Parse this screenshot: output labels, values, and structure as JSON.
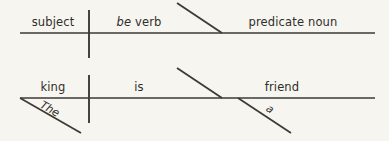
{
  "page": {
    "background_color": "#f7f5f0",
    "line_color": "#3a3a38",
    "text_color": "#2e2e2c"
  },
  "diagrams": [
    {
      "id": "template-row",
      "role": "pattern",
      "subject": "subject",
      "verb_italic_part": "be",
      "verb_plain_part": " verb",
      "verb_full": "be verb",
      "complement": "predicate noun",
      "modifiers": []
    },
    {
      "id": "example-row",
      "role": "example",
      "subject": "king",
      "verb_italic_part": "",
      "verb_plain_part": "is",
      "verb_full": "is",
      "complement": "friend",
      "modifiers": [
        {
          "word": "The",
          "attaches_to": "subject",
          "position": "left"
        },
        {
          "word": "a",
          "attaches_to": "complement",
          "position": "right"
        }
      ]
    }
  ],
  "geometry": {
    "row1": {
      "baseline_y": 33,
      "baseline_x1": 20,
      "baseline_x2": 375,
      "divider_x": 89,
      "divider_y1": 10,
      "divider_y2": 58,
      "slant_x1": 177,
      "slant_y1": 3,
      "slant_x2": 222,
      "slant_y2": 33,
      "subject_x": 53,
      "verb_x": 139,
      "complement_x": 293,
      "label_y": 26
    },
    "row2": {
      "baseline_y": 98,
      "baseline_x1": 20,
      "baseline_x2": 375,
      "divider_x": 89,
      "divider_y1": 75,
      "divider_y2": 123,
      "slant_x1": 177,
      "slant_y1": 68,
      "slant_x2": 222,
      "slant_y2": 98,
      "subject_x": 53,
      "verb_x": 139,
      "complement_x": 282,
      "label_y": 91,
      "mod_the_x1": 20,
      "mod_the_y1": 98,
      "mod_the_x2": 81,
      "mod_the_y2": 133,
      "mod_the_label_x": 48,
      "mod_the_label_y": 112,
      "mod_the_angle": 30,
      "mod_a_x1": 238,
      "mod_a_y1": 98,
      "mod_a_x2": 291,
      "mod_a_y2": 133,
      "mod_a_label_x": 268,
      "mod_a_label_y": 112,
      "mod_a_angle": 33
    }
  }
}
